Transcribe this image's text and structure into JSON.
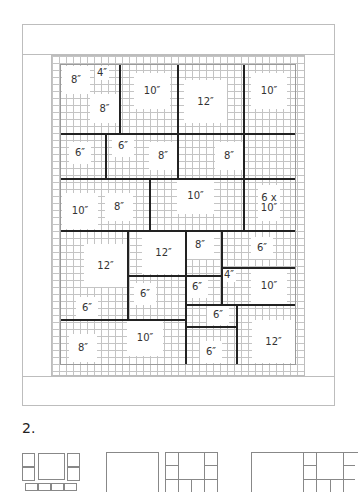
{
  "figure": {
    "section_number": "2.",
    "blocks": [
      {
        "id": "b1",
        "label": "8″"
      },
      {
        "id": "b2",
        "label": "4″"
      },
      {
        "id": "b3",
        "label": "8″"
      },
      {
        "id": "b4",
        "label": "10″"
      },
      {
        "id": "b5",
        "label": "12″"
      },
      {
        "id": "b6",
        "label": "10″"
      },
      {
        "id": "b7",
        "label": "6″"
      },
      {
        "id": "b8",
        "label": "6″"
      },
      {
        "id": "b9",
        "label": "8″"
      },
      {
        "id": "b10",
        "label": "8″"
      },
      {
        "id": "b11",
        "label": "10″"
      },
      {
        "id": "b12",
        "label": "8″"
      },
      {
        "id": "b13",
        "label": "10″"
      },
      {
        "id": "b14",
        "label": "6 x 10″"
      },
      {
        "id": "b15",
        "label": "12″"
      },
      {
        "id": "b16",
        "label": "12″"
      },
      {
        "id": "b17",
        "label": "8″"
      },
      {
        "id": "b18",
        "label": "6″"
      },
      {
        "id": "b19",
        "label": "4″"
      },
      {
        "id": "b20",
        "label": "10″"
      },
      {
        "id": "b21",
        "label": "6″"
      },
      {
        "id": "b22",
        "label": "6″"
      },
      {
        "id": "b23",
        "label": "6″"
      },
      {
        "id": "b24",
        "label": "6″"
      },
      {
        "id": "b25",
        "label": "10″"
      },
      {
        "id": "b26",
        "label": "8″"
      },
      {
        "id": "b27",
        "label": "6″"
      },
      {
        "id": "b28",
        "label": "12″"
      }
    ]
  }
}
